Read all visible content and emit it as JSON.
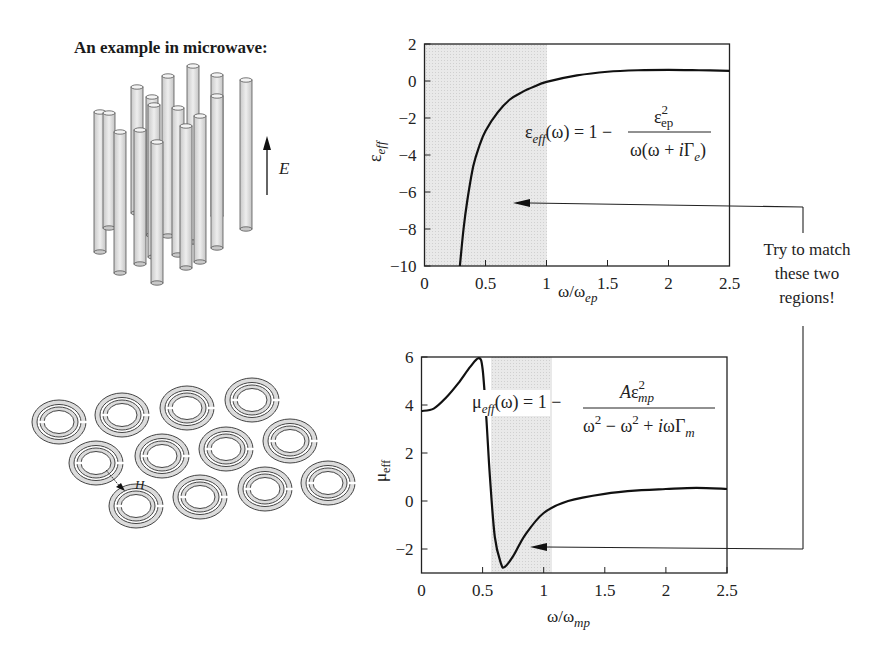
{
  "title": "An example in microwave:",
  "left_illustrations": {
    "wires": {
      "label": "E",
      "count": 16
    },
    "split_rings": {
      "label": "H",
      "count": 12
    }
  },
  "annotation": {
    "lines": [
      "Try to match",
      "these two",
      "regions!"
    ]
  },
  "chart_data": [
    {
      "type": "line",
      "title": "",
      "xlabel": "ω/ω_ep",
      "ylabel": "ε_eff",
      "xlim": [
        0,
        2.5
      ],
      "ylim": [
        -10,
        2
      ],
      "x_ticks": [
        "0",
        "0.5",
        "1",
        "1.5",
        "2",
        "2.5"
      ],
      "y_ticks": [
        "2",
        "0",
        "−2",
        "−4",
        "−6",
        "−8",
        "−10"
      ],
      "shaded_region": [
        0,
        1
      ],
      "grid": false,
      "formula": "ε_eff(ω) = 1 − ε_ep² / (ω(ω + iΓ_e))",
      "series": [
        {
          "name": "ε_eff",
          "x": [
            0.29,
            0.32,
            0.35,
            0.4,
            0.45,
            0.5,
            0.6,
            0.7,
            0.8,
            0.9,
            1.0,
            1.25,
            1.5,
            1.75,
            2.0,
            2.25,
            2.5
          ],
          "y": [
            -10,
            -8.0,
            -6.5,
            -4.6,
            -3.5,
            -2.7,
            -1.7,
            -1.0,
            -0.6,
            -0.3,
            -0.05,
            0.3,
            0.5,
            0.58,
            0.6,
            0.58,
            0.55
          ]
        }
      ]
    },
    {
      "type": "line",
      "title": "",
      "xlabel": "ω/ω_mp",
      "ylabel": "μ_eff",
      "xlim": [
        0,
        2.5
      ],
      "ylim": [
        -3,
        6
      ],
      "x_ticks": [
        "0",
        "0.5",
        "1",
        "1.5",
        "2",
        "2.5"
      ],
      "y_ticks": [
        "6",
        "4",
        "2",
        "0",
        "−2"
      ],
      "shaded_region": [
        0.57,
        1.05
      ],
      "grid": false,
      "formula": "μ_eff(ω) = 1 − Aε_mp² / (ω² − ω² + iωΓ_m)",
      "series": [
        {
          "name": "μ_eff",
          "x": [
            0,
            0.1,
            0.2,
            0.3,
            0.4,
            0.47,
            0.5,
            0.53,
            0.56,
            0.6,
            0.65,
            0.68,
            0.75,
            0.85,
            1.0,
            1.2,
            1.5,
            1.8,
            2.0,
            2.25,
            2.5
          ],
          "y": [
            3.75,
            3.85,
            4.3,
            4.9,
            5.6,
            5.95,
            5.5,
            3.5,
            1.0,
            -1.5,
            -2.6,
            -2.75,
            -2.3,
            -1.4,
            -0.5,
            0.0,
            0.3,
            0.45,
            0.5,
            0.55,
            0.5
          ]
        }
      ]
    }
  ]
}
